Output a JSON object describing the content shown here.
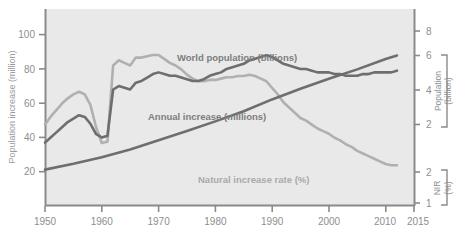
{
  "chart_data": {
    "type": "line",
    "title": "",
    "xlabel": "",
    "ylabel": "Population increase (million)",
    "xlim": [
      1950,
      2015
    ],
    "ylim": [
      0,
      115
    ],
    "grid": false,
    "legend_position": "inline-annotations",
    "x_ticks": [
      1950,
      1960,
      1970,
      1980,
      1990,
      2000,
      2010,
      2015
    ],
    "x_tick_labels": [
      "1950",
      "1960",
      "1970",
      "1980",
      "1990",
      "2000",
      "2010",
      "2015"
    ],
    "y_ticks": [
      20,
      40,
      60,
      80,
      100
    ],
    "y_tick_labels": [
      "20",
      "40",
      "60",
      "80",
      "100"
    ],
    "axes": {
      "left": {
        "label": "Population increase (million)",
        "ticks": [
          20,
          40,
          60,
          80,
          100
        ],
        "range": [
          0,
          115
        ]
      },
      "right_upper": {
        "label_line1": "Population",
        "label_line2": "(billion)",
        "ticks": [
          2,
          4,
          6,
          8
        ],
        "tick_labels": [
          "2",
          "4",
          "6",
          "8"
        ],
        "range": [
          1.1,
          8.9
        ]
      },
      "right_lower": {
        "label_line1": "NIR",
        "label_line2": "(%)",
        "ticks": [
          1,
          2
        ],
        "tick_labels": [
          "1",
          "2"
        ],
        "range": [
          0.85,
          2.35
        ]
      }
    },
    "series": [
      {
        "name": "World population (billions)",
        "annotation": "World population (billions)",
        "color": "#6e6e6e",
        "axis": "right_upper",
        "units": "billions",
        "x": [
          1950,
          1955,
          1960,
          1965,
          1970,
          1975,
          1980,
          1985,
          1990,
          1995,
          2000,
          2005,
          2010,
          2012
        ],
        "values": [
          2.54,
          2.77,
          3.03,
          3.34,
          3.7,
          4.07,
          4.45,
          4.85,
          5.32,
          5.74,
          6.14,
          6.51,
          6.92,
          7.06
        ]
      },
      {
        "name": "Annual increase (millions)",
        "annotation": "Annual increase (millions)",
        "color": "#6e6e6e",
        "axis": "left",
        "units": "millions",
        "x": [
          1950,
          1951,
          1952,
          1953,
          1954,
          1955,
          1956,
          1957,
          1958,
          1959,
          1960,
          1961,
          1962,
          1963,
          1964,
          1965,
          1966,
          1967,
          1968,
          1969,
          1970,
          1971,
          1972,
          1973,
          1974,
          1975,
          1976,
          1977,
          1978,
          1979,
          1980,
          1981,
          1982,
          1983,
          1984,
          1985,
          1986,
          1987,
          1988,
          1989,
          1990,
          1991,
          1992,
          1993,
          1994,
          1995,
          1996,
          1997,
          1998,
          1999,
          2000,
          2001,
          2002,
          2003,
          2004,
          2005,
          2006,
          2007,
          2008,
          2009,
          2010,
          2011,
          2012
        ],
        "values": [
          37,
          40,
          43,
          46,
          49,
          51,
          53,
          52,
          48,
          42,
          40,
          41,
          68,
          70,
          69,
          68,
          72,
          73,
          75,
          77,
          78,
          77,
          76,
          76,
          75,
          74,
          73,
          73,
          74,
          76,
          77,
          78,
          80,
          81,
          82,
          83,
          85,
          86,
          87,
          88,
          87,
          85,
          83,
          82,
          81,
          80,
          80,
          79,
          78,
          78,
          78,
          77,
          77,
          76,
          76,
          76,
          77,
          77,
          78,
          78,
          78,
          78,
          79
        ]
      },
      {
        "name": "Natural increase rate (%)",
        "annotation": "Natural increase rate (%)",
        "color": "#b0b0b0",
        "axis": "right_lower",
        "units": "%",
        "x": [
          1950,
          1951,
          1952,
          1953,
          1954,
          1955,
          1956,
          1957,
          1958,
          1959,
          1960,
          1961,
          1962,
          1963,
          1964,
          1965,
          1966,
          1967,
          1968,
          1969,
          1970,
          1971,
          1972,
          1973,
          1974,
          1975,
          1976,
          1977,
          1978,
          1979,
          1980,
          1981,
          1982,
          1983,
          1984,
          1985,
          1986,
          1987,
          1988,
          1989,
          1990,
          1991,
          1992,
          1993,
          1994,
          1995,
          1996,
          1997,
          1998,
          1999,
          2000,
          2001,
          2002,
          2003,
          2004,
          2005,
          2006,
          2007,
          2008,
          2009,
          2010,
          2011,
          2012
        ],
        "values": [
          1.47,
          1.53,
          1.58,
          1.63,
          1.67,
          1.7,
          1.72,
          1.7,
          1.62,
          1.45,
          1.33,
          1.34,
          1.92,
          1.96,
          1.94,
          1.92,
          1.98,
          1.98,
          1.99,
          2.0,
          2.0,
          1.97,
          1.94,
          1.92,
          1.89,
          1.85,
          1.82,
          1.8,
          1.8,
          1.81,
          1.81,
          1.82,
          1.83,
          1.83,
          1.84,
          1.84,
          1.85,
          1.84,
          1.82,
          1.8,
          1.75,
          1.7,
          1.64,
          1.6,
          1.56,
          1.52,
          1.5,
          1.47,
          1.44,
          1.42,
          1.4,
          1.37,
          1.35,
          1.32,
          1.3,
          1.27,
          1.25,
          1.23,
          1.21,
          1.19,
          1.17,
          1.16,
          1.16
        ]
      }
    ]
  }
}
